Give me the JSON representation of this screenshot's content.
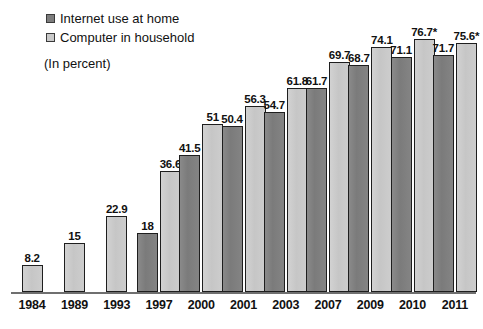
{
  "legend": {
    "items": [
      {
        "label": "Internet use at home",
        "swatch": "dark",
        "color": "#7e7e7e"
      },
      {
        "label": "Computer in household",
        "swatch": "light",
        "color": "#cacaca"
      }
    ]
  },
  "units_note": "(In percent)",
  "footnote_marker": "*",
  "chart_data": {
    "type": "bar",
    "title": "",
    "subtitle": "(In percent)",
    "xlabel": "",
    "ylabel": "",
    "ylim": [
      0,
      80
    ],
    "grid": false,
    "legend_position": "top-left",
    "categories": [
      "1984",
      "1989",
      "1993",
      "1997",
      "2000",
      "2001",
      "2003",
      "2007",
      "2009",
      "2010",
      "2011"
    ],
    "series": [
      {
        "name": "Internet use at home",
        "color": "#7e7e7e",
        "values": [
          null,
          null,
          null,
          18,
          41.5,
          50.4,
          54.7,
          61.7,
          68.7,
          71.1,
          71.7
        ],
        "labels": [
          "",
          "",
          "",
          "18",
          "41.5",
          "50.4",
          "54.7",
          "61.7",
          "68.7",
          "71.1",
          "71.7"
        ]
      },
      {
        "name": "Computer in household",
        "color": "#cacaca",
        "values": [
          8.2,
          15,
          22.9,
          36.6,
          51,
          56.3,
          61.8,
          69.7,
          74.1,
          76.7,
          75.6
        ],
        "labels": [
          "8.2",
          "15",
          "22.9",
          "36.6",
          "51",
          "56.3",
          "61.8",
          "69.7",
          "74.1",
          "76.7*",
          "75.6*"
        ]
      }
    ]
  }
}
